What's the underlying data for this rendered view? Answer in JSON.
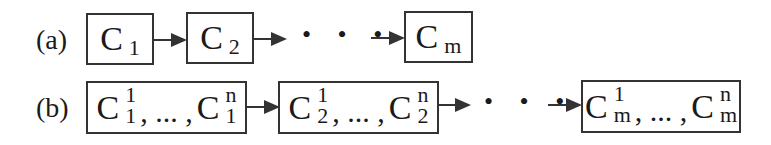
{
  "diagram": {
    "type": "sequence-flow",
    "rows": [
      {
        "label": "(a)",
        "nodes": [
          {
            "symbol": "C",
            "sub": "1"
          },
          {
            "symbol": "C",
            "sub": "2"
          },
          {
            "symbol": "C",
            "sub": "m"
          }
        ],
        "ellipsis": "• • •"
      },
      {
        "label": "(b)",
        "nodes": [
          {
            "first": {
              "symbol": "C",
              "sup": "1",
              "sub": "1"
            },
            "separator": ", ... ,",
            "last": {
              "symbol": "C",
              "sup": "n",
              "sub": "1"
            }
          },
          {
            "first": {
              "symbol": "C",
              "sup": "1",
              "sub": "2"
            },
            "separator": ", ... ,",
            "last": {
              "symbol": "C",
              "sup": "n",
              "sub": "2"
            }
          },
          {
            "first": {
              "symbol": "C",
              "sup": "1",
              "sub": "m"
            },
            "separator": ", ... ,",
            "last": {
              "symbol": "C",
              "sup": "n",
              "sub": "m"
            }
          }
        ],
        "ellipsis": "• • •"
      }
    ],
    "colors": {
      "stroke": "#333333",
      "text": "#1a1a1a",
      "background": "#ffffff"
    }
  }
}
